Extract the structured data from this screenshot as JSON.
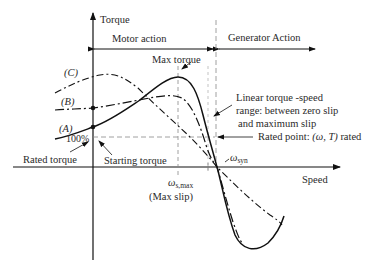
{
  "diagram": {
    "axes": {
      "y_label": "Torque",
      "x_label": "Speed"
    },
    "regions": {
      "motor": "Motor action",
      "generator": "Generator Action"
    },
    "curve_labels": {
      "a": "(A)",
      "b": "(B)",
      "c": "(C)"
    },
    "annotations": {
      "max_torque": "Max torque",
      "linear_range_line1": "Linear torque -speed",
      "linear_range_line2": "range: between zero slip",
      "linear_range_line3": "and maximum slip",
      "rated_point_prefix": "Rated point:",
      "rated_point_tuple": "(ω, T)",
      "rated_point_suffix": "rated",
      "percent_100": "100%",
      "rated_torque": "Rated torque",
      "starting_torque": "Starting torque",
      "omega_syn_symbol": "ω",
      "omega_syn_sub": "syn",
      "omega_smax_symbol": "ω",
      "omega_smax_sub": "s,max",
      "max_slip": "(Max slip)"
    },
    "colors": {
      "line": "#111111",
      "dashed_guides": "#888888",
      "background": "#ffffff"
    }
  }
}
